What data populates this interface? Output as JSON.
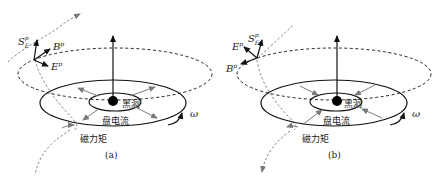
{
  "panels": [
    {
      "id": "a",
      "caption": "(a)",
      "labels": {
        "black_hole": "黑洞",
        "disk_current": "盘电流",
        "magnetic_torque": "磁力矩",
        "omega": "ω",
        "S": "S",
        "S_sup": "p",
        "S_sub": "E",
        "B": "B",
        "B_sup": "p",
        "E": "E",
        "E_sup": "p"
      },
      "current_direction": "outward"
    },
    {
      "id": "b",
      "caption": "(b)",
      "labels": {
        "black_hole": "黑洞",
        "disk_current": "盘电流",
        "magnetic_torque": "磁力矩",
        "omega": "ω",
        "S": "S",
        "S_sup": "p",
        "S_sub": "E",
        "B": "B",
        "B_sup": "p",
        "E": "E",
        "E_sup": "p"
      },
      "current_direction": "inward"
    }
  ],
  "colors": {
    "ink": "#1a1a1a",
    "gray_arrow": "#7a7a7a",
    "dashed": "#222222"
  }
}
